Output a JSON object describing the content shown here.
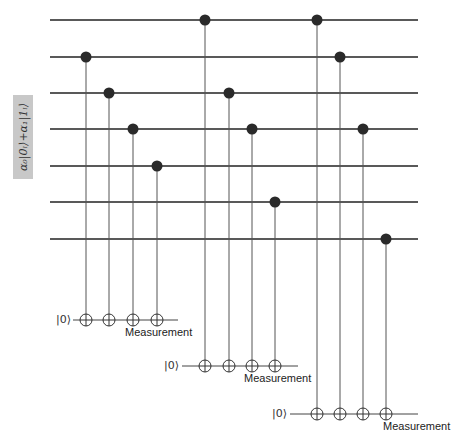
{
  "diagram": {
    "type": "quantum-circuit",
    "input_state_label": "α₀|0ₗ⟩+α₁|1ₗ⟩",
    "data_qubits_y": [
      20,
      57,
      93,
      129,
      166,
      202,
      239
    ],
    "ancillas": [
      {
        "label": "|0⟩",
        "measurement_label": "Measurement",
        "y": 320,
        "controls": [
          1,
          2,
          3,
          4
        ]
      },
      {
        "label": "|0⟩",
        "measurement_label": "Measurement",
        "y": 366,
        "controls": [
          0,
          2,
          3,
          5
        ]
      },
      {
        "label": "|0⟩",
        "measurement_label": "Measurement",
        "y": 414,
        "controls": [
          0,
          1,
          3,
          6
        ]
      }
    ],
    "colors": {
      "line": "#222222",
      "dot": "#2a2a2a",
      "box": "#c8c8c8"
    }
  }
}
